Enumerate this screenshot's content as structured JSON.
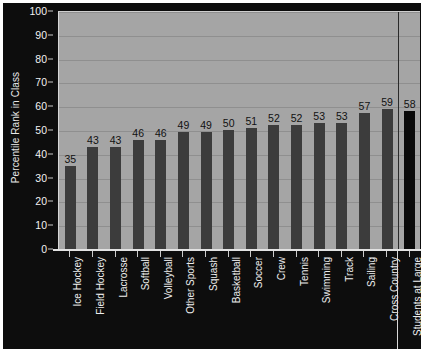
{
  "chart_data": {
    "type": "bar",
    "title": "",
    "xlabel": "",
    "ylabel": "Percentile Rank in Class",
    "ylim": [
      0,
      100
    ],
    "ytick_step": 10,
    "yticks": [
      0,
      10,
      20,
      30,
      40,
      50,
      60,
      70,
      80,
      90,
      100
    ],
    "grid": true,
    "legend": "none",
    "categories": [
      "Ice Hockey",
      "Field Hockey",
      "Lacrosse",
      "Softball",
      "Volleyball",
      "Other Sports",
      "Squash",
      "Basketball",
      "Soccer",
      "Crew",
      "Tennis",
      "Swimming",
      "Track",
      "Sailing",
      "Cross Country",
      "Students at Large"
    ],
    "values": [
      35,
      43,
      43,
      46,
      46,
      49,
      49,
      50,
      51,
      52,
      52,
      53,
      53,
      57,
      59,
      58
    ],
    "highlight_index": 15,
    "separator_before_index": 15,
    "annotations": []
  },
  "colors": {
    "figure_background": "#0d0d0d",
    "plot_background": "#a5a5a5",
    "bar": "#3c3c3c",
    "bar_highlight": "#0a0a0a",
    "gridline": "#8f8f8f",
    "axis_text": "#f2f2f2",
    "value_label": "#111111",
    "separator": "#2a2a2a",
    "border": "#ffffff"
  }
}
